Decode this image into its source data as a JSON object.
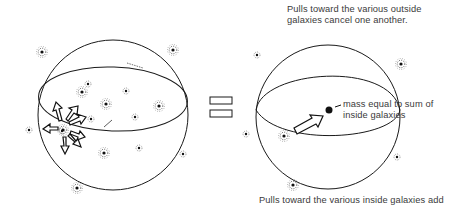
{
  "captions": {
    "top_line1": "Pulls toward the various outside",
    "top_line2": "galaxies cancel one another.",
    "mass_line1": "mass equal to sum of",
    "mass_line2": "inside galaxies",
    "bottom": "Pulls toward the various inside galaxies add"
  },
  "symbols": {
    "equals": "="
  },
  "colors": {
    "ink": "#1a1a1a",
    "text": "#3a3a3a",
    "background": "#ffffff"
  }
}
